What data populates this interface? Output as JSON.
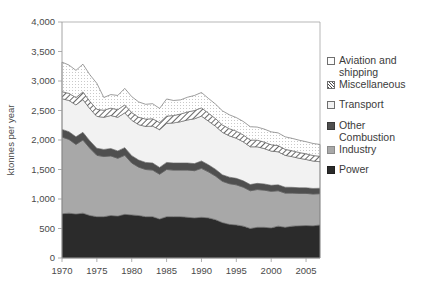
{
  "chart_data": {
    "type": "area",
    "stacked": true,
    "title": "",
    "xlabel": "",
    "ylabel": "ktonnes per year",
    "ylim": [
      0,
      4000
    ],
    "xlim": [
      1970,
      2007
    ],
    "grid": false,
    "legend_position": "right",
    "ytick_labels": [
      "0",
      "500",
      "1,000",
      "1,500",
      "2,000",
      "2,500",
      "3,000",
      "3,500",
      "4,000"
    ],
    "ytick_values": [
      0,
      500,
      1000,
      1500,
      2000,
      2500,
      3000,
      3500,
      4000
    ],
    "xtick_labels": [
      "1970",
      "1975",
      "1980",
      "1985",
      "1990",
      "1995",
      "2000",
      "2005"
    ],
    "xtick_values": [
      1970,
      1975,
      1980,
      1985,
      1990,
      1995,
      2000,
      2005
    ],
    "x": [
      1970,
      1971,
      1972,
      1973,
      1974,
      1975,
      1976,
      1977,
      1978,
      1979,
      1980,
      1981,
      1982,
      1983,
      1984,
      1985,
      1986,
      1987,
      1988,
      1989,
      1990,
      1991,
      1992,
      1993,
      1994,
      1995,
      1996,
      1997,
      1998,
      1999,
      2000,
      2001,
      2002,
      2003,
      2004,
      2005,
      2006,
      2007
    ],
    "series": [
      {
        "name": "Power",
        "color": "#2b2b2b",
        "pattern": "solid",
        "values": [
          750,
          760,
          745,
          760,
          720,
          700,
          700,
          720,
          710,
          740,
          730,
          720,
          700,
          700,
          660,
          700,
          700,
          700,
          690,
          680,
          690,
          680,
          650,
          600,
          570,
          560,
          540,
          500,
          520,
          520,
          510,
          540,
          520,
          540,
          545,
          550,
          545,
          560
        ]
      },
      {
        "name": "Industry",
        "color": "#a8a8a8",
        "pattern": "solid",
        "values": [
          1300,
          1250,
          1180,
          1240,
          1140,
          1040,
          1020,
          1010,
          980,
          1000,
          880,
          820,
          800,
          790,
          760,
          800,
          790,
          790,
          800,
          800,
          830,
          780,
          740,
          700,
          690,
          680,
          660,
          640,
          640,
          630,
          620,
          600,
          580,
          560,
          550,
          545,
          540,
          530
        ]
      },
      {
        "name": "Other Combustion",
        "color": "#4f4f4f",
        "pattern": "solid",
        "values": [
          130,
          130,
          130,
          130,
          125,
          120,
          120,
          125,
          125,
          130,
          125,
          120,
          120,
          120,
          115,
          120,
          120,
          120,
          120,
          120,
          125,
          120,
          115,
          110,
          110,
          110,
          108,
          105,
          105,
          105,
          102,
          100,
          100,
          98,
          96,
          95,
          94,
          92
        ]
      },
      {
        "name": "Transport",
        "color": "#f2f2f2",
        "pattern": "solid",
        "values": [
          520,
          530,
          540,
          555,
          545,
          540,
          545,
          560,
          570,
          590,
          600,
          600,
          610,
          625,
          640,
          660,
          680,
          700,
          730,
          760,
          760,
          740,
          730,
          720,
          700,
          680,
          660,
          640,
          620,
          600,
          580,
          560,
          540,
          520,
          500,
          480,
          465,
          450
        ]
      },
      {
        "name": "Miscellaneous",
        "color": "#ffffff",
        "pattern": "diagonal-hatch",
        "values": [
          120,
          120,
          125,
          130,
          125,
          120,
          120,
          125,
          130,
          135,
          130,
          125,
          125,
          125,
          120,
          125,
          125,
          130,
          135,
          140,
          140,
          135,
          130,
          125,
          122,
          120,
          118,
          115,
          112,
          110,
          108,
          105,
          102,
          100,
          98,
          96,
          94,
          92
        ]
      },
      {
        "name": "Aviation and shipping",
        "color": "#fbfbfb",
        "pattern": "fine-stipple",
        "values": [
          500,
          480,
          460,
          470,
          450,
          440,
          215,
          230,
          240,
          280,
          270,
          260,
          250,
          255,
          240,
          290,
          255,
          240,
          250,
          255,
          260,
          250,
          245,
          240,
          235,
          230,
          228,
          225,
          222,
          220,
          218,
          215,
          212,
          210,
          208,
          205,
          203,
          200
        ]
      }
    ]
  },
  "legend": {
    "items": [
      {
        "label": "Aviation and\nshipping",
        "swatch": "aviation"
      },
      {
        "label": "Miscellaneous",
        "swatch": "misc"
      },
      {
        "label": "Transport",
        "swatch": "transport"
      },
      {
        "label": "Other\nCombustion",
        "swatch": "othercomb"
      },
      {
        "label": "Industry",
        "swatch": "industry"
      },
      {
        "label": "Power",
        "swatch": "power"
      }
    ]
  }
}
